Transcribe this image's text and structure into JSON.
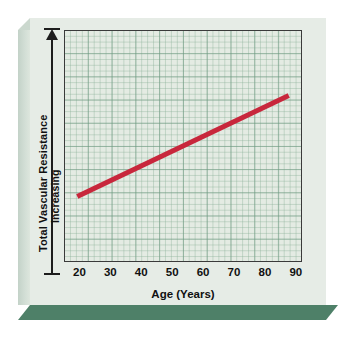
{
  "figure": {
    "background_color": "#ffffff",
    "plaque_face_color": "#e6ece6",
    "plaque_bevel_color": "#cbd8ce",
    "plaque_shadow_color": "#4e8068",
    "plot_background_color": "#e4ebe3",
    "grid_color": "#6a967e",
    "axis_color": "#3a3a3a",
    "text_color": "#111111"
  },
  "chart_data": {
    "type": "line",
    "title": "",
    "xlabel": "Age (Years)",
    "ylabel": "Total Vascular Resistance",
    "ylabel_secondary": "Increasing",
    "xlim": [
      15,
      92
    ],
    "ylim": [
      0,
      100
    ],
    "xticks": [
      20,
      30,
      40,
      50,
      60,
      70,
      80,
      90
    ],
    "xtick_labels": [
      "20",
      "30",
      "40",
      "50",
      "60",
      "70",
      "80",
      "90"
    ],
    "yticks": [],
    "ytick_labels": [],
    "grid": true,
    "grid_style": "graph-paper major and minor",
    "legend": false,
    "legend_position": "none",
    "y_axis_direction_arrow": "up",
    "series": [
      {
        "name": "Total Vascular Resistance vs Age",
        "color": "#c8273c",
        "line_width": 5,
        "x": [
          19,
          88
        ],
        "y": [
          28,
          72
        ],
        "points": [
          {
            "x": 19,
            "y": 28
          },
          {
            "x": 88,
            "y": 72
          }
        ],
        "description": "Total vascular resistance increases linearly with age"
      }
    ],
    "annotations": []
  },
  "axis": {
    "x_title": "Age (Years)",
    "y_title_outer": "Total Vascular Resistance",
    "y_title_inner": "Increasing"
  }
}
